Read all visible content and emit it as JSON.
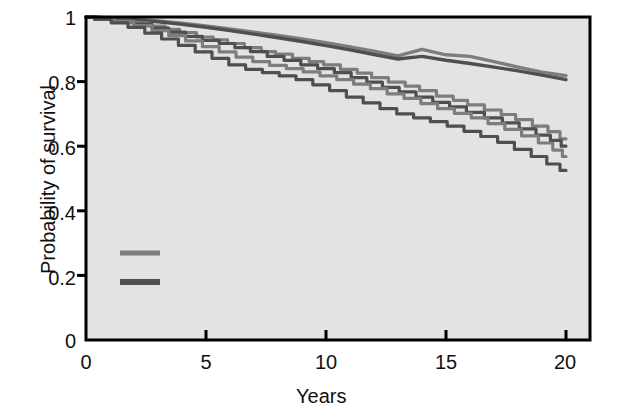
{
  "chart_data": {
    "type": "line",
    "title": "",
    "xlabel": "Years",
    "ylabel": "Probability of survival",
    "xlim": [
      0,
      21
    ],
    "ylim": [
      0,
      1
    ],
    "xticks": [
      0,
      5,
      10,
      15,
      20
    ],
    "xtick_labels": [
      "0",
      "5",
      "10",
      "15",
      "20"
    ],
    "yticks": [
      0,
      0.2,
      0.4,
      0.6,
      0.8,
      1
    ],
    "ytick_labels": [
      "0",
      "0.2",
      "0.4",
      "0.6",
      "0.8",
      "1"
    ],
    "grid": false,
    "legend_position": "inside-lower-left",
    "plot_background": "#e3e3e3",
    "colors": {
      "radical_mastectomy": "#7d7d7d",
      "breast_conserving_therapy": "#4f4f4f",
      "axis": "#000000"
    },
    "annotations": [
      {
        "name": "expected",
        "text": "Expected",
        "x": 16.0,
        "y": 0.905
      },
      {
        "name": "observed-le-1cm-line1",
        "text": "Observed; diameter",
        "x": 14.5,
        "y": 0.775
      },
      {
        "name": "observed-le-1cm-line2",
        "text": "≤1 cm",
        "x": 18.6,
        "y": 0.705
      },
      {
        "name": "observed-gt-1cm",
        "text": "Observed; diameter >1 cm",
        "x": 10.4,
        "y": 0.45
      }
    ],
    "legend": [
      {
        "label": "Radical mastectomy",
        "color": "#7d7d7d"
      },
      {
        "label": "Breast-conserving therapy",
        "color": "#4f4f4f"
      }
    ],
    "series": [
      {
        "name": "Expected — radical mastectomy",
        "group": "radical_mastectomy",
        "annotation": "Expected",
        "color": "#7d7d7d",
        "points": [
          [
            0,
            1.0
          ],
          [
            1,
            0.998
          ],
          [
            2,
            0.994
          ],
          [
            3,
            0.988
          ],
          [
            4,
            0.981
          ],
          [
            5,
            0.972
          ],
          [
            6,
            0.963
          ],
          [
            7,
            0.953
          ],
          [
            8,
            0.943
          ],
          [
            9,
            0.932
          ],
          [
            10,
            0.92
          ],
          [
            11,
            0.907
          ],
          [
            12,
            0.894
          ],
          [
            13,
            0.88
          ],
          [
            14,
            0.9
          ],
          [
            15,
            0.883
          ],
          [
            16,
            0.878
          ],
          [
            17,
            0.862
          ],
          [
            18,
            0.845
          ],
          [
            19,
            0.829
          ],
          [
            20,
            0.818
          ]
        ]
      },
      {
        "name": "Expected — breast-conserving therapy",
        "group": "breast_conserving_therapy",
        "annotation": "Expected",
        "color": "#4f4f4f",
        "points": [
          [
            0,
            1.0
          ],
          [
            1,
            0.997
          ],
          [
            2,
            0.992
          ],
          [
            3,
            0.985
          ],
          [
            4,
            0.977
          ],
          [
            5,
            0.968
          ],
          [
            6,
            0.958
          ],
          [
            7,
            0.947
          ],
          [
            8,
            0.936
          ],
          [
            9,
            0.924
          ],
          [
            10,
            0.911
          ],
          [
            11,
            0.898
          ],
          [
            12,
            0.884
          ],
          [
            13,
            0.87
          ],
          [
            14,
            0.878
          ],
          [
            15,
            0.866
          ],
          [
            16,
            0.856
          ],
          [
            17,
            0.845
          ],
          [
            18,
            0.833
          ],
          [
            19,
            0.82
          ],
          [
            20,
            0.806
          ]
        ]
      },
      {
        "name": "Observed; diameter ≤1 cm — radical mastectomy",
        "group": "radical_mastectomy",
        "annotation": "Observed; diameter ≤1 cm",
        "color": "#7d7d7d",
        "points": [
          [
            0,
            1.0
          ],
          [
            0.8,
            0.997
          ],
          [
            1.5,
            0.99
          ],
          [
            2.2,
            0.982
          ],
          [
            3,
            0.972
          ],
          [
            3.6,
            0.962
          ],
          [
            4.2,
            0.952
          ],
          [
            5,
            0.938
          ],
          [
            5.6,
            0.929
          ],
          [
            6.2,
            0.918
          ],
          [
            7,
            0.905
          ],
          [
            7.6,
            0.893
          ],
          [
            8.2,
            0.885
          ],
          [
            9,
            0.872
          ],
          [
            9.6,
            0.862
          ],
          [
            10.2,
            0.852
          ],
          [
            11,
            0.838
          ],
          [
            11.6,
            0.826
          ],
          [
            12.2,
            0.812
          ],
          [
            13,
            0.798
          ],
          [
            13.6,
            0.786
          ],
          [
            14.2,
            0.772
          ],
          [
            15,
            0.755
          ],
          [
            15.6,
            0.742
          ],
          [
            16.2,
            0.728
          ],
          [
            17,
            0.712
          ],
          [
            17.6,
            0.698
          ],
          [
            18.2,
            0.682
          ],
          [
            19,
            0.662
          ],
          [
            19.5,
            0.645
          ],
          [
            20,
            0.623
          ]
        ]
      },
      {
        "name": "Observed; diameter ≤1 cm — breast-conserving therapy",
        "group": "breast_conserving_therapy",
        "annotation": "Observed; diameter ≤1 cm",
        "color": "#4f4f4f",
        "points": [
          [
            0,
            1.0
          ],
          [
            0.9,
            0.996
          ],
          [
            1.6,
            0.988
          ],
          [
            2.4,
            0.978
          ],
          [
            3.1,
            0.966
          ],
          [
            3.8,
            0.953
          ],
          [
            4.5,
            0.94
          ],
          [
            5.2,
            0.928
          ],
          [
            5.9,
            0.918
          ],
          [
            6.5,
            0.905
          ],
          [
            7.2,
            0.893
          ],
          [
            7.9,
            0.878
          ],
          [
            8.6,
            0.866
          ],
          [
            9.3,
            0.852
          ],
          [
            10,
            0.84
          ],
          [
            10.7,
            0.828
          ],
          [
            11.4,
            0.812
          ],
          [
            12,
            0.798
          ],
          [
            12.7,
            0.782
          ],
          [
            13.4,
            0.768
          ],
          [
            14.1,
            0.752
          ],
          [
            14.8,
            0.736
          ],
          [
            15.5,
            0.722
          ],
          [
            16.2,
            0.705
          ],
          [
            17,
            0.688
          ],
          [
            17.7,
            0.672
          ],
          [
            18.4,
            0.654
          ],
          [
            19.1,
            0.634
          ],
          [
            19.6,
            0.618
          ],
          [
            20,
            0.6
          ]
        ]
      },
      {
        "name": "Observed; diameter >1 cm — radical mastectomy",
        "group": "radical_mastectomy",
        "annotation": "Observed; diameter >1 cm",
        "color": "#7d7d7d",
        "points": [
          [
            0,
            1.0
          ],
          [
            0.8,
            0.995
          ],
          [
            1.6,
            0.986
          ],
          [
            2.4,
            0.973
          ],
          [
            3.1,
            0.958
          ],
          [
            3.8,
            0.942
          ],
          [
            4.5,
            0.926
          ],
          [
            5.2,
            0.908
          ],
          [
            5.9,
            0.892
          ],
          [
            6.6,
            0.876
          ],
          [
            7.3,
            0.862
          ],
          [
            8,
            0.85
          ],
          [
            8.7,
            0.84
          ],
          [
            9.4,
            0.83
          ],
          [
            10.1,
            0.818
          ],
          [
            10.8,
            0.806
          ],
          [
            11.5,
            0.792
          ],
          [
            12.2,
            0.778
          ],
          [
            12.9,
            0.762
          ],
          [
            13.6,
            0.748
          ],
          [
            14.3,
            0.732
          ],
          [
            15,
            0.716
          ],
          [
            15.7,
            0.702
          ],
          [
            16.4,
            0.688
          ],
          [
            17.1,
            0.67
          ],
          [
            17.8,
            0.652
          ],
          [
            18.5,
            0.632
          ],
          [
            19.2,
            0.61
          ],
          [
            19.7,
            0.588
          ],
          [
            20,
            0.568
          ]
        ]
      },
      {
        "name": "Observed; diameter >1 cm — breast-conserving therapy",
        "group": "breast_conserving_therapy",
        "annotation": "Observed; diameter >1 cm",
        "color": "#4f4f4f",
        "points": [
          [
            0,
            1.0
          ],
          [
            0.7,
            0.993
          ],
          [
            1.4,
            0.982
          ],
          [
            2.1,
            0.968
          ],
          [
            2.8,
            0.95
          ],
          [
            3.5,
            0.932
          ],
          [
            4.2,
            0.912
          ],
          [
            4.9,
            0.892
          ],
          [
            5.6,
            0.872
          ],
          [
            6.3,
            0.852
          ],
          [
            7,
            0.838
          ],
          [
            7.7,
            0.828
          ],
          [
            8.4,
            0.818
          ],
          [
            9.1,
            0.806
          ],
          [
            9.8,
            0.79
          ],
          [
            10.5,
            0.772
          ],
          [
            11.2,
            0.752
          ],
          [
            11.9,
            0.734
          ],
          [
            12.6,
            0.716
          ],
          [
            13.3,
            0.7
          ],
          [
            14,
            0.688
          ],
          [
            14.7,
            0.676
          ],
          [
            15.4,
            0.662
          ],
          [
            16.1,
            0.646
          ],
          [
            16.8,
            0.63
          ],
          [
            17.5,
            0.612
          ],
          [
            18.2,
            0.59
          ],
          [
            18.9,
            0.568
          ],
          [
            19.5,
            0.545
          ],
          [
            20,
            0.525
          ]
        ]
      }
    ]
  }
}
